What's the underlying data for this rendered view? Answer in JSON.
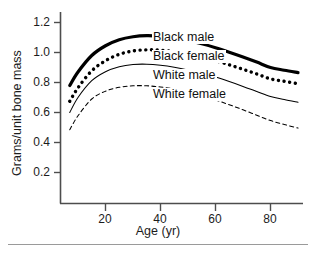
{
  "chart_data": {
    "type": "line",
    "title": "",
    "xlabel": "Age (yr)",
    "ylabel": "Grams/unit bone mass",
    "xlim": [
      5,
      92
    ],
    "ylim": [
      0.1,
      1.28
    ],
    "xticks": [
      20,
      40,
      60,
      80
    ],
    "xtick_labels": [
      "20",
      "40",
      "60",
      "80"
    ],
    "yticks": [
      0.2,
      0.4,
      0.6,
      0.8,
      1.0,
      1.2
    ],
    "ytick_labels": [
      "0.2",
      "0.4",
      "0.6",
      "0.8",
      "1.0",
      "1.2"
    ],
    "grid": false,
    "legend_position": "inline-right-of-curves",
    "x": [
      7,
      10,
      15,
      20,
      25,
      30,
      35,
      40,
      45,
      50,
      55,
      60,
      65,
      70,
      75,
      80,
      85,
      90
    ],
    "series": [
      {
        "name": "Black male",
        "style": "thick-solid",
        "color": "#000000",
        "values": [
          0.78,
          0.87,
          0.98,
          1.045,
          1.085,
          1.105,
          1.112,
          1.108,
          1.097,
          1.08,
          1.058,
          1.032,
          1.002,
          0.97,
          0.936,
          0.9,
          0.882,
          0.866
        ]
      },
      {
        "name": "Black female",
        "style": "thick-dotted",
        "color": "#000000",
        "values": [
          0.675,
          0.765,
          0.878,
          0.945,
          0.988,
          1.01,
          1.018,
          1.015,
          1.005,
          0.99,
          0.97,
          0.946,
          0.918,
          0.888,
          0.857,
          0.824,
          0.808,
          0.792
        ]
      },
      {
        "name": "White male",
        "style": "thin-solid",
        "color": "#000000",
        "values": [
          0.6,
          0.7,
          0.812,
          0.872,
          0.905,
          0.92,
          0.922,
          0.915,
          0.902,
          0.884,
          0.862,
          0.836,
          0.806,
          0.774,
          0.74,
          0.706,
          0.686,
          0.668
        ]
      },
      {
        "name": "White female",
        "style": "thin-dashed",
        "color": "#000000",
        "values": [
          0.485,
          0.578,
          0.69,
          0.742,
          0.768,
          0.778,
          0.778,
          0.77,
          0.756,
          0.736,
          0.712,
          0.684,
          0.652,
          0.618,
          0.582,
          0.546,
          0.52,
          0.496
        ]
      }
    ],
    "series_labels": [
      {
        "text": "Black male"
      },
      {
        "text": "Black female"
      },
      {
        "text": "White male"
      },
      {
        "text": "White female"
      }
    ]
  }
}
